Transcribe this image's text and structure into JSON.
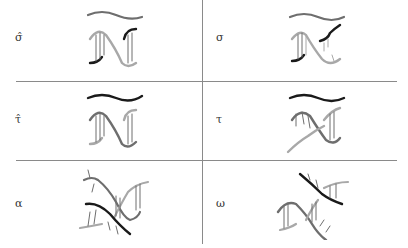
{
  "figure": {
    "rows": [
      {
        "left": {
          "label": "σ̂",
          "glyph": "dna-hat-sigma-icon"
        },
        "right": {
          "label": "σ",
          "glyph": "dna-sigma-icon"
        }
      },
      {
        "left": {
          "label": "τ̂",
          "glyph": "dna-hat-tau-icon"
        },
        "right": {
          "label": "τ",
          "glyph": "dna-tau-icon"
        }
      },
      {
        "left": {
          "label": "α",
          "glyph": "dna-alpha-icon"
        },
        "right": {
          "label": "ω",
          "glyph": "dna-omega-icon"
        }
      }
    ],
    "colors": {
      "black_strand": "#1a1a1a",
      "dark_gray_strand": "#6e6e6e",
      "light_gray_strand": "#a8a8a8",
      "grid": "#8a8a8a"
    }
  }
}
